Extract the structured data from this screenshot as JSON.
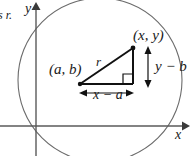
{
  "figure": {
    "margin_text_fragment": "s r.",
    "axes": {
      "x_label": "x",
      "y_label": "y",
      "x_axis_y": 126,
      "y_axis_x": 36
    },
    "circle": {
      "center_x": 100,
      "center_y": 80,
      "radius": 82,
      "stroke": "#666666"
    },
    "triangle": {
      "center_point_label": "(a, b)",
      "circle_point_label": "(x, y)",
      "hypotenuse_label": "r",
      "horizontal_leg_label": "x − a",
      "vertical_leg_label": "y − b",
      "right_angle_marker": "right-angle-square",
      "vertex_center": [
        80,
        84
      ],
      "vertex_point": [
        133,
        48
      ],
      "vertex_corner": [
        133,
        84
      ],
      "stroke": "#111111"
    },
    "dimension_arrows": {
      "horizontal_y": 93,
      "horizontal_x1": 80,
      "horizontal_x2": 133,
      "vertical_x": 148,
      "vertical_y1": 48,
      "vertical_y2": 84
    },
    "colors": {
      "ink": "#1a1a1a",
      "axis": "#555555",
      "curve": "#666666",
      "triangle": "#111111"
    }
  }
}
